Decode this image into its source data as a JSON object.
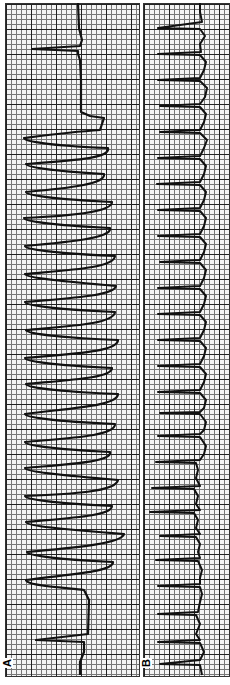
{
  "figure": {
    "orientation": "rotated 90 degrees counter-clockwise",
    "panels": [
      {
        "label": "A",
        "description": "ECG strip: sinus beat, run of wide-complex sinusoidal tachycardia (~20 complexes), then sinus beat"
      },
      {
        "label": "B",
        "description": "ECG strip: regular narrow-complex tachycardia (~26 complexes)"
      }
    ]
  },
  "colors": {
    "trace": "#111111",
    "grid_major": "#222222",
    "grid_minor": "#777777",
    "paper": "#f4f4f4"
  }
}
